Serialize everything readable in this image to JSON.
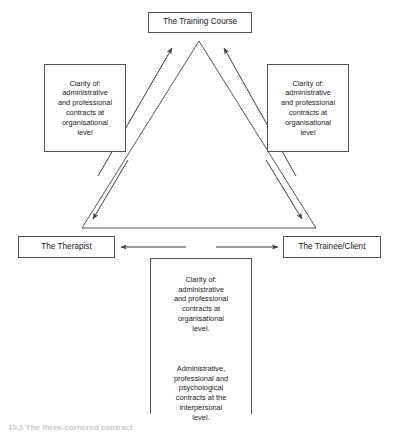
{
  "figure": {
    "caption": "10.1 The three-cornered contract"
  },
  "nodes": {
    "training_course": {
      "label": "The Training Course"
    },
    "left_contract": {
      "label": "Clarity of:\nadministrative\nand professional\ncontracts at\norganisational\nlevel"
    },
    "right_contract": {
      "label": "Clarity of:\nadministrative\nand professional\ncontracts at\norganisational\nlevel"
    },
    "therapist": {
      "label": "The Therapist"
    },
    "trainee_client": {
      "label": "The Trainee/Client"
    },
    "interpersonal_contract": {
      "paragraph_1": "Clarity of:\nadministrative\nand professional\ncontracts at\norganisational\nlevel.",
      "paragraph_2": "Administrative,\nprofessional and\npsychological\ncontracts at the\ninterpersonal\nlevel."
    }
  },
  "connectors": {
    "triangle_left_edge": "triangle-left-edge",
    "triangle_right_edge": "triangle-right-edge",
    "triangle_base_edge": "triangle-base-edge",
    "arrow_left_box_to_apex": "arrow-up-right",
    "arrow_right_box_to_apex": "arrow-up-left",
    "arrow_left_box_to_therapist": "arrow-down-left",
    "arrow_right_box_to_trainee": "arrow-down-right",
    "arrow_therapist_trainee": "double-headed-arrow"
  },
  "colors": {
    "line": "#555555",
    "box_border": "#555555",
    "text": "#1a1a1a",
    "background": "#ffffff",
    "caption": "#c9c9c9"
  }
}
